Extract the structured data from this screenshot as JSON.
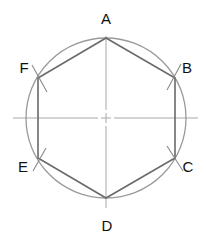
{
  "diagram": {
    "type": "geometric-construction",
    "colors": {
      "circle": "#9a9a9a",
      "hexagon": "#6a6a6a",
      "centerline": "#a8a8a8",
      "arc_marks": "#8a8a8a",
      "labels": "#111111"
    },
    "center": {
      "x": 106,
      "y": 118
    },
    "radius": 80,
    "vertices": [
      {
        "id": "A",
        "label": "A",
        "x": 106,
        "y": 38,
        "label_x": 106,
        "label_y": 24
      },
      {
        "id": "B",
        "label": "B",
        "x": 175,
        "y": 78,
        "label_x": 187,
        "label_y": 73
      },
      {
        "id": "C",
        "label": "C",
        "x": 175,
        "y": 158,
        "label_x": 188,
        "label_y": 172
      },
      {
        "id": "D",
        "label": "D",
        "x": 106,
        "y": 198,
        "label_x": 107,
        "label_y": 231
      },
      {
        "id": "E",
        "label": "E",
        "x": 38,
        "y": 158,
        "label_x": 23,
        "label_y": 172
      },
      {
        "id": "F",
        "label": "F",
        "x": 38,
        "y": 78,
        "label_x": 24,
        "label_y": 73
      }
    ]
  }
}
